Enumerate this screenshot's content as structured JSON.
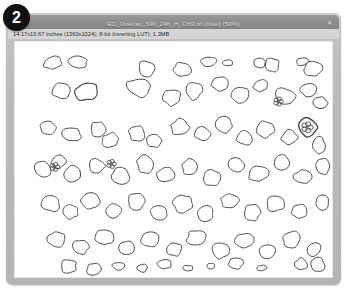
{
  "panel": {
    "badge_label": "2"
  },
  "window": {
    "title": "EC_Overlay_SW_24h_H_CH2.tif (blue) (50%)",
    "info": "14.17x10.67 inches (1360x1024); 8-bit (inverting LUT); 1.3MB",
    "close_icon": "×",
    "frame_color": "#b2b2b2",
    "titlebar_color": "#8e8e8e",
    "infobar_color": "#d6d6d6",
    "canvas_color": "#ffffff",
    "outline_color": "#4a4a4a",
    "badge_color": "#111111"
  },
  "canvas": {
    "label": "segmented-cell-overlay",
    "outlines": [
      {
        "cx": 38,
        "cy": 21,
        "rx": 9,
        "ry": 6,
        "rot": -12,
        "w": 1.0
      },
      {
        "cx": 63,
        "cy": 20,
        "rx": 10,
        "ry": 6,
        "rot": 8,
        "w": 1.0
      },
      {
        "cx": 132,
        "cy": 27,
        "rx": 8,
        "ry": 8,
        "rot": 0,
        "w": 1.0
      },
      {
        "cx": 168,
        "cy": 28,
        "rx": 9,
        "ry": 7,
        "rot": 15,
        "w": 1.0
      },
      {
        "cx": 195,
        "cy": 20,
        "rx": 8,
        "ry": 5,
        "rot": -5,
        "w": 1.0
      },
      {
        "cx": 214,
        "cy": 21,
        "rx": 5,
        "ry": 3,
        "rot": 0,
        "w": 1.0
      },
      {
        "cx": 246,
        "cy": 21,
        "rx": 6,
        "ry": 5,
        "rot": 10,
        "w": 1.0
      },
      {
        "cx": 259,
        "cy": 23,
        "rx": 7,
        "ry": 7,
        "rot": 0,
        "w": 1.0
      },
      {
        "cx": 289,
        "cy": 20,
        "rx": 6,
        "ry": 4,
        "rot": -8,
        "w": 1.0
      },
      {
        "cx": 300,
        "cy": 27,
        "rx": 9,
        "ry": 8,
        "rot": 5,
        "w": 1.0
      },
      {
        "cx": 46,
        "cy": 49,
        "rx": 9,
        "ry": 8,
        "rot": 20,
        "w": 1.0
      },
      {
        "cx": 72,
        "cy": 50,
        "rx": 11,
        "ry": 9,
        "rot": -10,
        "w": 1.2
      },
      {
        "cx": 124,
        "cy": 46,
        "rx": 12,
        "ry": 9,
        "rot": 12,
        "w": 1.0
      },
      {
        "cx": 158,
        "cy": 56,
        "rx": 9,
        "ry": 8,
        "rot": 0,
        "w": 1.0
      },
      {
        "cx": 180,
        "cy": 49,
        "rx": 8,
        "ry": 9,
        "rot": 0,
        "w": 1.0
      },
      {
        "cx": 206,
        "cy": 42,
        "rx": 8,
        "ry": 7,
        "rot": 0,
        "w": 1.0
      },
      {
        "cx": 226,
        "cy": 53,
        "rx": 9,
        "ry": 8,
        "rot": 0,
        "w": 1.0
      },
      {
        "cx": 247,
        "cy": 44,
        "rx": 7,
        "ry": 6,
        "rot": 0,
        "w": 1.0
      },
      {
        "cx": 272,
        "cy": 55,
        "rx": 10,
        "ry": 8,
        "rot": 22,
        "w": 1.0
      },
      {
        "cx": 296,
        "cy": 48,
        "rx": 9,
        "ry": 7,
        "rot": -18,
        "w": 1.0
      },
      {
        "cx": 307,
        "cy": 61,
        "rx": 7,
        "ry": 6,
        "rot": 0,
        "w": 1.0
      },
      {
        "cx": 33,
        "cy": 86,
        "rx": 8,
        "ry": 7,
        "rot": 0,
        "w": 1.0
      },
      {
        "cx": 57,
        "cy": 93,
        "rx": 10,
        "ry": 7,
        "rot": 18,
        "w": 1.0
      },
      {
        "cx": 84,
        "cy": 88,
        "rx": 8,
        "ry": 8,
        "rot": 0,
        "w": 1.0
      },
      {
        "cx": 96,
        "cy": 99,
        "rx": 9,
        "ry": 7,
        "rot": -15,
        "w": 1.0
      },
      {
        "cx": 123,
        "cy": 92,
        "rx": 8,
        "ry": 8,
        "rot": 0,
        "w": 1.0
      },
      {
        "cx": 140,
        "cy": 99,
        "rx": 7,
        "ry": 7,
        "rot": 0,
        "w": 1.0
      },
      {
        "cx": 166,
        "cy": 86,
        "rx": 9,
        "ry": 8,
        "rot": 0,
        "w": 1.0
      },
      {
        "cx": 189,
        "cy": 93,
        "rx": 8,
        "ry": 7,
        "rot": 0,
        "w": 1.0
      },
      {
        "cx": 210,
        "cy": 84,
        "rx": 9,
        "ry": 8,
        "rot": 10,
        "w": 1.0
      },
      {
        "cx": 231,
        "cy": 97,
        "rx": 8,
        "ry": 7,
        "rot": 0,
        "w": 1.0
      },
      {
        "cx": 252,
        "cy": 88,
        "rx": 10,
        "ry": 8,
        "rot": -12,
        "w": 1.0
      },
      {
        "cx": 276,
        "cy": 96,
        "rx": 8,
        "ry": 7,
        "rot": 0,
        "w": 1.0
      },
      {
        "cx": 295,
        "cy": 86,
        "rx": 9,
        "ry": 9,
        "rot": 0,
        "w": 1.4
      },
      {
        "cx": 306,
        "cy": 104,
        "rx": 6,
        "ry": 8,
        "rot": 0,
        "w": 1.0
      },
      {
        "cx": 28,
        "cy": 128,
        "rx": 9,
        "ry": 7,
        "rot": 25,
        "w": 1.0
      },
      {
        "cx": 44,
        "cy": 121,
        "rx": 8,
        "ry": 6,
        "rot": -20,
        "w": 1.0
      },
      {
        "cx": 58,
        "cy": 133,
        "rx": 9,
        "ry": 8,
        "rot": 0,
        "w": 1.0
      },
      {
        "cx": 82,
        "cy": 125,
        "rx": 8,
        "ry": 7,
        "rot": 0,
        "w": 1.0
      },
      {
        "cx": 106,
        "cy": 135,
        "rx": 9,
        "ry": 8,
        "rot": 15,
        "w": 1.0
      },
      {
        "cx": 131,
        "cy": 123,
        "rx": 8,
        "ry": 9,
        "rot": 0,
        "w": 1.0
      },
      {
        "cx": 152,
        "cy": 134,
        "rx": 9,
        "ry": 7,
        "rot": 0,
        "w": 1.0
      },
      {
        "cx": 176,
        "cy": 126,
        "rx": 8,
        "ry": 8,
        "rot": 0,
        "w": 1.0
      },
      {
        "cx": 199,
        "cy": 137,
        "rx": 9,
        "ry": 8,
        "rot": 0,
        "w": 1.0
      },
      {
        "cx": 222,
        "cy": 124,
        "rx": 8,
        "ry": 7,
        "rot": 0,
        "w": 1.0
      },
      {
        "cx": 245,
        "cy": 133,
        "rx": 10,
        "ry": 8,
        "rot": -15,
        "w": 1.0
      },
      {
        "cx": 268,
        "cy": 122,
        "rx": 8,
        "ry": 8,
        "rot": 0,
        "w": 1.0
      },
      {
        "cx": 290,
        "cy": 136,
        "rx": 9,
        "ry": 7,
        "rot": 0,
        "w": 1.0
      },
      {
        "cx": 310,
        "cy": 126,
        "rx": 7,
        "ry": 8,
        "rot": 0,
        "w": 1.0
      },
      {
        "cx": 36,
        "cy": 163,
        "rx": 9,
        "ry": 8,
        "rot": 0,
        "w": 1.0
      },
      {
        "cx": 56,
        "cy": 171,
        "rx": 8,
        "ry": 7,
        "rot": 0,
        "w": 1.0
      },
      {
        "cx": 76,
        "cy": 160,
        "rx": 9,
        "ry": 8,
        "rot": 12,
        "w": 1.0
      },
      {
        "cx": 99,
        "cy": 170,
        "rx": 8,
        "ry": 7,
        "rot": 0,
        "w": 1.0
      },
      {
        "cx": 122,
        "cy": 161,
        "rx": 9,
        "ry": 8,
        "rot": 0,
        "w": 1.0
      },
      {
        "cx": 145,
        "cy": 172,
        "rx": 8,
        "ry": 7,
        "rot": 0,
        "w": 1.0
      },
      {
        "cx": 169,
        "cy": 163,
        "rx": 10,
        "ry": 9,
        "rot": -10,
        "w": 1.0
      },
      {
        "cx": 192,
        "cy": 173,
        "rx": 8,
        "ry": 8,
        "rot": 0,
        "w": 1.0
      },
      {
        "cx": 216,
        "cy": 160,
        "rx": 9,
        "ry": 7,
        "rot": 0,
        "w": 1.0
      },
      {
        "cx": 239,
        "cy": 172,
        "rx": 8,
        "ry": 8,
        "rot": 0,
        "w": 1.0
      },
      {
        "cx": 262,
        "cy": 163,
        "rx": 9,
        "ry": 8,
        "rot": 0,
        "w": 1.0
      },
      {
        "cx": 286,
        "cy": 171,
        "rx": 8,
        "ry": 7,
        "rot": 0,
        "w": 1.0
      },
      {
        "cx": 309,
        "cy": 162,
        "rx": 7,
        "ry": 8,
        "rot": 0,
        "w": 1.0
      },
      {
        "cx": 42,
        "cy": 199,
        "rx": 9,
        "ry": 8,
        "rot": 0,
        "w": 1.0
      },
      {
        "cx": 66,
        "cy": 207,
        "rx": 8,
        "ry": 7,
        "rot": 0,
        "w": 1.0
      },
      {
        "cx": 90,
        "cy": 197,
        "rx": 9,
        "ry": 8,
        "rot": 0,
        "w": 1.0
      },
      {
        "cx": 112,
        "cy": 208,
        "rx": 8,
        "ry": 7,
        "rot": 0,
        "w": 1.0
      },
      {
        "cx": 136,
        "cy": 199,
        "rx": 9,
        "ry": 8,
        "rot": 0,
        "w": 1.0
      },
      {
        "cx": 160,
        "cy": 209,
        "rx": 8,
        "ry": 7,
        "rot": 0,
        "w": 1.0
      },
      {
        "cx": 183,
        "cy": 198,
        "rx": 10,
        "ry": 8,
        "rot": 0,
        "w": 1.0
      },
      {
        "cx": 207,
        "cy": 210,
        "rx": 8,
        "ry": 8,
        "rot": 0,
        "w": 1.0
      },
      {
        "cx": 231,
        "cy": 200,
        "rx": 9,
        "ry": 7,
        "rot": 0,
        "w": 1.0
      },
      {
        "cx": 254,
        "cy": 211,
        "rx": 8,
        "ry": 7,
        "rot": 0,
        "w": 1.0
      },
      {
        "cx": 278,
        "cy": 199,
        "rx": 9,
        "ry": 8,
        "rot": 0,
        "w": 1.0
      },
      {
        "cx": 301,
        "cy": 209,
        "rx": 7,
        "ry": 7,
        "rot": 0,
        "w": 1.0
      },
      {
        "cx": 54,
        "cy": 226,
        "rx": 8,
        "ry": 7,
        "rot": 0,
        "w": 1.0
      },
      {
        "cx": 79,
        "cy": 229,
        "rx": 7,
        "ry": 6,
        "rot": 0,
        "w": 1.0
      },
      {
        "cx": 104,
        "cy": 226,
        "rx": 6,
        "ry": 4,
        "rot": 0,
        "w": 1.0
      },
      {
        "cx": 128,
        "cy": 228,
        "rx": 5,
        "ry": 4,
        "rot": 0,
        "w": 1.0
      },
      {
        "cx": 150,
        "cy": 224,
        "rx": 7,
        "ry": 5,
        "rot": 0,
        "w": 1.0
      },
      {
        "cx": 174,
        "cy": 228,
        "rx": 5,
        "ry": 3,
        "rot": 0,
        "w": 1.0
      },
      {
        "cx": 197,
        "cy": 226,
        "rx": 4,
        "ry": 3,
        "rot": 0,
        "w": 1.0
      },
      {
        "cx": 222,
        "cy": 223,
        "rx": 7,
        "ry": 6,
        "rot": 0,
        "w": 1.0
      },
      {
        "cx": 248,
        "cy": 228,
        "rx": 5,
        "ry": 3,
        "rot": 0,
        "w": 1.0
      },
      {
        "cx": 288,
        "cy": 224,
        "rx": 6,
        "ry": 6,
        "rot": 0,
        "w": 1.0
      },
      {
        "cx": 305,
        "cy": 225,
        "rx": 7,
        "ry": 7,
        "rot": 0,
        "w": 1.0
      }
    ],
    "clusters": [
      {
        "cx": 294,
        "cy": 86,
        "r": 6
      },
      {
        "cx": 97,
        "cy": 123,
        "r": 5
      },
      {
        "cx": 40,
        "cy": 126,
        "r": 5
      },
      {
        "cx": 265,
        "cy": 60,
        "r": 5
      }
    ]
  }
}
